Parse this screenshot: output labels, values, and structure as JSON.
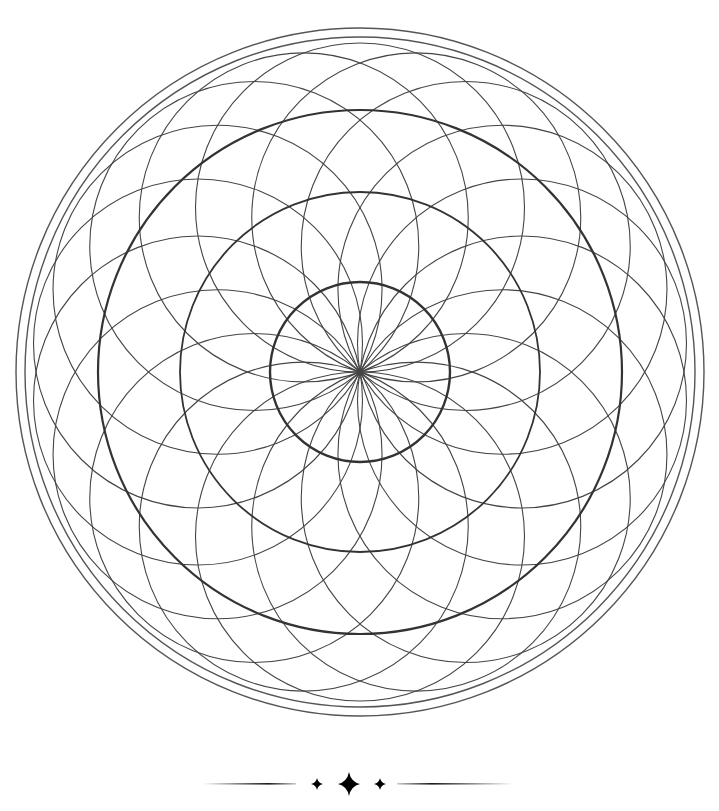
{
  "artwork": {
    "type": "mandala-coloring-page",
    "center": [
      360,
      372
    ],
    "stroke_color": "#3a3a3a",
    "background": "#ffffff",
    "outer_rings": [
      344,
      335
    ],
    "concentric_circles": [
      262,
      180,
      90
    ],
    "petal_circles": {
      "count": 18,
      "radius": 164.5,
      "start_angle_deg": 0
    }
  },
  "divider": {
    "y": 784,
    "line_left": [
      205,
      295
    ],
    "line_right": [
      398,
      512
    ],
    "stars": [
      {
        "x": 317,
        "size": "small"
      },
      {
        "x": 349,
        "size": "large"
      },
      {
        "x": 380,
        "size": "small"
      }
    ]
  }
}
